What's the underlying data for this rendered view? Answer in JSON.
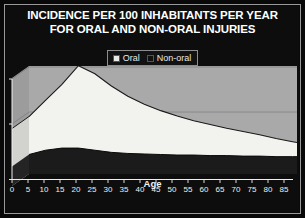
{
  "frame": {
    "background_color": "#080808",
    "border_color": "#9a9a9a"
  },
  "title": {
    "line1": "INCIDENCE PER 100 INHABITANTS PER YEAR",
    "line2": "FOR ORAL AND NON-ORAL INJURIES",
    "color": "#ffffff"
  },
  "legend": {
    "position": "top-center",
    "items": [
      {
        "label": "Oral",
        "color": "#e9e9e6",
        "swatch_name": "legend-swatch-oral"
      },
      {
        "label": "Non-oral",
        "color": "#111111",
        "swatch_name": "legend-swatch-non-oral"
      }
    ]
  },
  "chart_data": {
    "type": "area",
    "title": "INCIDENCE PER 100 INHABITANTS PER YEAR FOR ORAL AND NON-ORAL INJURIES",
    "subtitle": "",
    "xlabel": "Age",
    "ylabel": "",
    "xlim": [
      0,
      85
    ],
    "ylim": [
      0,
      20
    ],
    "grid": true,
    "legend_position": "top-center",
    "x": [
      0,
      5,
      10,
      15,
      20,
      25,
      30,
      35,
      40,
      45,
      50,
      55,
      60,
      65,
      70,
      75,
      80,
      85
    ],
    "xticks": [
      "0",
      "5",
      "10",
      "15",
      "20",
      "25",
      "30",
      "35",
      "40",
      "45",
      "50",
      "55",
      "60",
      "65",
      "70",
      "75",
      "80",
      "85"
    ],
    "yticks": [
      "0",
      "10",
      "20"
    ],
    "series": [
      {
        "name": "Oral",
        "color": "#e9e9e6",
        "values": [
          8.5,
          11.5,
          14.5,
          18.0,
          16.5,
          14.2,
          12.3,
          10.8,
          9.6,
          8.6,
          7.7,
          7.0,
          6.3,
          5.7,
          5.1,
          4.4,
          3.8,
          3.2
        ]
      },
      {
        "name": "Non-oral",
        "color": "#111111",
        "values": [
          1.4,
          2.2,
          2.6,
          2.6,
          2.2,
          1.8,
          1.6,
          1.5,
          1.4,
          1.3,
          1.3,
          1.2,
          1.2,
          1.1,
          1.1,
          1.0,
          1.0,
          1.0
        ]
      }
    ]
  },
  "axes": {
    "x_title": "Age",
    "x_title_color": "#f2f2f2",
    "tick_color": "#f0f0f0",
    "plot_back_wall_color": "#a8a8a8",
    "plot_floor_color": "#8f8f8f",
    "plot_side_wall_color": "#9b9b9b"
  }
}
